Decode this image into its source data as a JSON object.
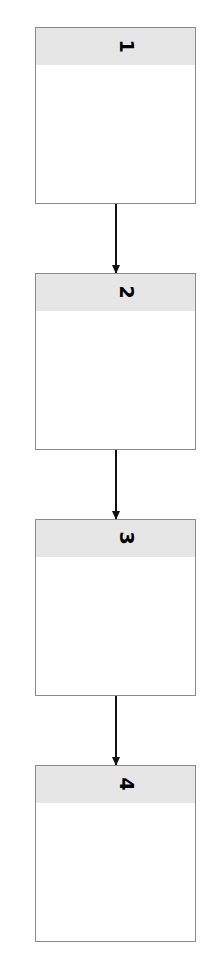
{
  "diagram": {
    "type": "vertical-flow",
    "nodes": [
      {
        "id": 1,
        "label": "1"
      },
      {
        "id": 2,
        "label": "2"
      },
      {
        "id": 3,
        "label": "3"
      },
      {
        "id": 4,
        "label": "4"
      }
    ],
    "edges": [
      {
        "from": 1,
        "to": 2
      },
      {
        "from": 2,
        "to": 3
      },
      {
        "from": 3,
        "to": 4
      }
    ],
    "colors": {
      "header": "#e6e6e6",
      "border": "#8a8a8a",
      "arrow": "#111111"
    }
  }
}
